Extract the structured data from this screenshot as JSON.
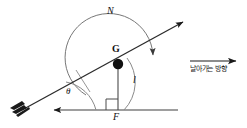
{
  "figure": {
    "type": "physics-free-body-diagram",
    "background_color": "#ffffff",
    "stroke_color": "#222222"
  },
  "labels": {
    "normal_force": "N",
    "center_of_gravity": "G",
    "moment_arm": "l",
    "force": "F",
    "angle": "θ",
    "flight_direction": "날아가는 방향"
  },
  "elements": {
    "arrow_shaft": {
      "name": "arrow-shaft",
      "from": [
        18,
        112
      ],
      "to": [
        188,
        20
      ],
      "has_fletching": true,
      "has_arrowhead": true
    },
    "ground_line": {
      "name": "ground-line",
      "from": [
        50,
        110
      ],
      "to": [
        178,
        110
      ],
      "arrowhead": "left"
    },
    "vertical_force_line": {
      "name": "force-line",
      "from": [
        118,
        65
      ],
      "to": [
        118,
        110
      ],
      "right_angle_marker": true
    },
    "normal_arc": {
      "name": "normal-force-arc",
      "arrowhead": "down-right"
    },
    "moment_arc": {
      "name": "moment-arm-arc"
    },
    "angle_arc": {
      "name": "angle-arc"
    },
    "gravity_point": {
      "name": "center-of-gravity-point",
      "cx": 118,
      "cy": 64,
      "r": 5
    },
    "direction_arrow": {
      "name": "flight-direction-arrow",
      "from": [
        191,
        61
      ],
      "to": [
        238,
        61
      ],
      "arrowhead": "right"
    }
  }
}
